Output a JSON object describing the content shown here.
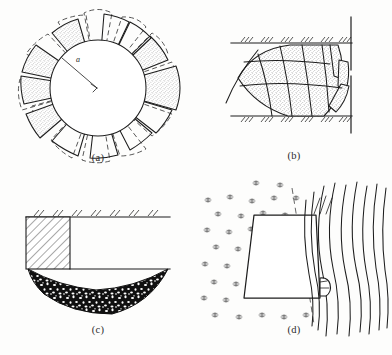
{
  "figure": {
    "background_color": "#fdfdfc",
    "ink_color": "#1d1d1d",
    "panel_count": 4
  },
  "panels": [
    {
      "id": "a",
      "caption": "(a)",
      "description": "Circular tunnel cross-section with radial petal-shaped rotational slip surfaces arranged around the circumference; alternating stippled (shaded) wedges and dashed construction outlines.",
      "labels": {
        "radius": "a"
      },
      "features": [
        "circular-opening",
        "radius-arrow",
        "radial-petal-wedges",
        "stipple-fill",
        "dashed-construction-lines"
      ],
      "petal_count": 12,
      "stipple_color": "#7d7d7d"
    },
    {
      "id": "b",
      "caption": "(b)",
      "description": "Tunnel heading face with a curved multi-block sliding wedge mechanism between two hatched ground boundaries and a vertical tunnel-face line with an opening gap.",
      "features": [
        "upper-hatched-boundary",
        "lower-hatched-boundary",
        "vertical-face-line",
        "face-opening-gap",
        "curved-block-grid-wedge",
        "stipple-fill",
        "slip-line"
      ],
      "grid_rows": 3,
      "grid_cols": 5,
      "stipple_color": "#7d7d7d"
    },
    {
      "id": "c",
      "caption": "(c)",
      "description": "Vertical cut with a diagonally hatched retained block on the left and a dark mottled lens-shaped heave/collapse zone below the excavation level.",
      "features": [
        "ground-surface-line",
        "surface-hatching",
        "diagonally-hatched-block",
        "vertical-cut-face",
        "dark-mottled-lens-zone",
        "excavation-base-line"
      ],
      "mottle_color": "#111111"
    },
    {
      "id": "d",
      "caption": "(d)",
      "description": "Trapezoidal sliding block bounded by a dashed failure plane, with a stippled asterisk point-field on the left and a family of curved flow/deflection lines on the right, plus a small angular hook detail at the lower right corner.",
      "features": [
        "trapezoid-block",
        "dashed-failure-plane",
        "asterisk-point-field",
        "curved-flow-lines",
        "corner-hook-detail"
      ],
      "flow_line_count": 9,
      "marker_color": "#4a4a4a"
    }
  ]
}
